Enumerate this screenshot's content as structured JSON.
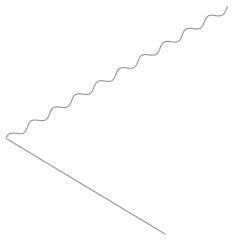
{
  "figure": {
    "width": 236,
    "height": 243,
    "background": "#ffffff",
    "stroke_color": "#9a9a9a",
    "stroke_width": 1.2
  },
  "shapes": {
    "vertex": {
      "x": 7,
      "y": 139
    },
    "straight_line": {
      "x1": 7,
      "y1": 139,
      "x2": 165,
      "y2": 234
    },
    "wavy_line": {
      "start": {
        "x": 7,
        "y": 139
      },
      "end": {
        "x": 228,
        "y": 8
      },
      "cycles": 10,
      "amplitude": 3.2
    }
  }
}
